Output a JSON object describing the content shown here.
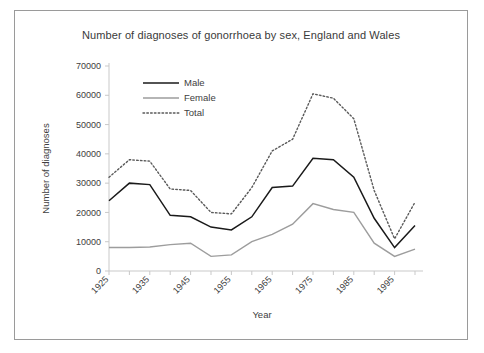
{
  "chart_data": {
    "type": "line",
    "title": "Number of diagnoses of gonorrhoea by sex, England and Wales",
    "xlabel": "Year",
    "ylabel": "Number of diagnoses",
    "xlim": [
      1925,
      2000
    ],
    "ylim": [
      0,
      70000
    ],
    "ytick_labels": [
      "70000",
      "60000",
      "50000",
      "40000",
      "30000",
      "20000",
      "10000",
      "0"
    ],
    "ytick_values": [
      70000,
      60000,
      50000,
      40000,
      30000,
      20000,
      10000,
      0
    ],
    "xtick_labels": [
      "1925",
      "1935",
      "1945",
      "1955",
      "1965",
      "1975",
      "1985",
      "1995"
    ],
    "xtick_values": [
      1925,
      1935,
      1945,
      1955,
      1965,
      1975,
      1985,
      1995
    ],
    "grid": false,
    "legend_position": "upper-left-inside",
    "x": [
      1925,
      1930,
      1935,
      1940,
      1945,
      1950,
      1955,
      1960,
      1965,
      1970,
      1975,
      1980,
      1985,
      1990,
      1995,
      2000
    ],
    "series": [
      {
        "name": "Male",
        "color": "#1a1a1a",
        "style": "solid",
        "values": [
          24000,
          30000,
          29500,
          19000,
          18500,
          15000,
          14000,
          18500,
          28500,
          29000,
          38500,
          38000,
          32000,
          18000,
          8000,
          15500
        ]
      },
      {
        "name": "Female",
        "color": "#9d9d9d",
        "style": "solid",
        "values": [
          8000,
          8000,
          8200,
          9000,
          9500,
          5000,
          5500,
          10000,
          12500,
          16000,
          23000,
          21000,
          20000,
          9500,
          5000,
          7500
        ]
      },
      {
        "name": "Total",
        "color": "#5a5a5a",
        "style": "dotted",
        "values": [
          32000,
          38000,
          37500,
          28000,
          27500,
          20000,
          19500,
          28500,
          41000,
          45000,
          60500,
          59000,
          52000,
          27500,
          11000,
          23500
        ]
      }
    ]
  }
}
